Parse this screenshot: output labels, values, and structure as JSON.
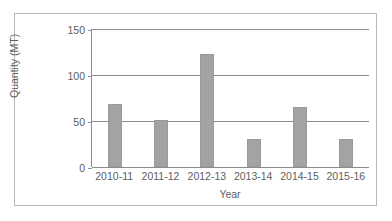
{
  "chart_data": {
    "type": "bar",
    "title": "",
    "categories": [
      "2010-11",
      "2011-12",
      "2012-13",
      "2013-14",
      "2014-15",
      "2015-16"
    ],
    "values": [
      68,
      51,
      123,
      30,
      65,
      30
    ],
    "series": [
      {
        "name": "Quantity (MT)",
        "values": [
          68,
          51,
          123,
          30,
          65,
          30
        ]
      }
    ],
    "xlabel": "Year",
    "ylabel": "Quantity (MT)",
    "ylim": [
      0,
      150
    ],
    "yticks": [
      0,
      50,
      100,
      150
    ],
    "ytick_labels": [
      "0",
      "50",
      "100",
      "150"
    ],
    "grid": "horizontal",
    "legend": "none",
    "bar_color": "#a3a3a3",
    "axis_color": "#8c8c8c",
    "text_color": "#5e5e5e",
    "frame_color": "#b9b9b9"
  }
}
